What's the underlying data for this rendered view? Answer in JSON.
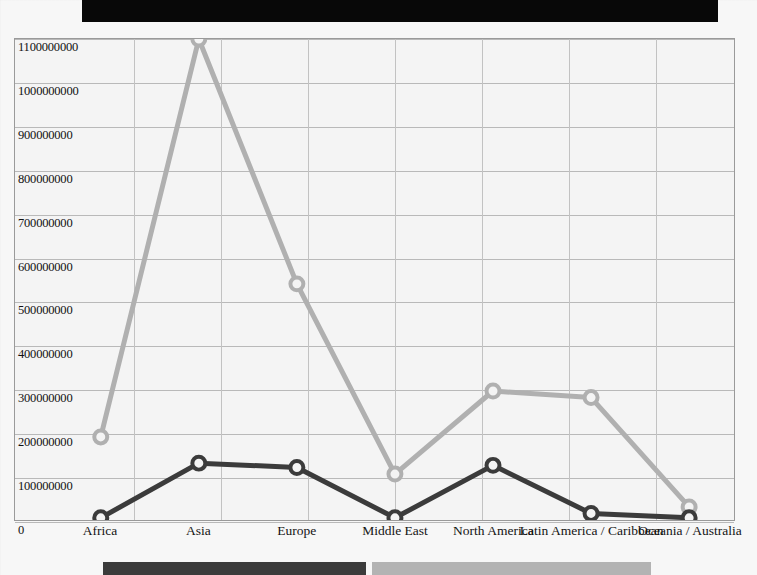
{
  "page": {
    "redaction_bar": "",
    "background_color": "#f7f7f7"
  },
  "chart_data": {
    "type": "line",
    "title": "",
    "xlabel": "",
    "ylabel": "",
    "ylim": [
      0,
      1100000000
    ],
    "ytick_step": 100000000,
    "grid": true,
    "legend_position": "bottom",
    "categories": [
      "Africa",
      "Asia",
      "Europe",
      "Middle East",
      "North America",
      "Latin America / Caribbean",
      "Oceania / Australia"
    ],
    "ytick_labels": [
      "1100000000",
      "1000000000",
      "900000000",
      "800000000",
      "700000000",
      "600000000",
      "500000000",
      "400000000",
      "300000000",
      "200000000",
      "100000000",
      "0"
    ],
    "ytick_values": [
      1100000000,
      1000000000,
      900000000,
      800000000,
      700000000,
      600000000,
      500000000,
      400000000,
      300000000,
      200000000,
      100000000,
      0
    ],
    "series": [
      {
        "name": "",
        "color": "#b0b0b0",
        "marker": "circle-open",
        "values": [
          190000000,
          1100000000,
          540000000,
          105000000,
          295000000,
          280000000,
          30000000
        ]
      },
      {
        "name": "",
        "color": "#3b3b3b",
        "marker": "circle-open",
        "values": [
          5000000,
          130000000,
          120000000,
          5000000,
          125000000,
          15000000,
          5000000
        ]
      }
    ]
  },
  "legend": {
    "swatch_dark_color": "#3b3b3b",
    "swatch_light_color": "#b3b3b3",
    "dark_label": "",
    "light_label": ""
  }
}
